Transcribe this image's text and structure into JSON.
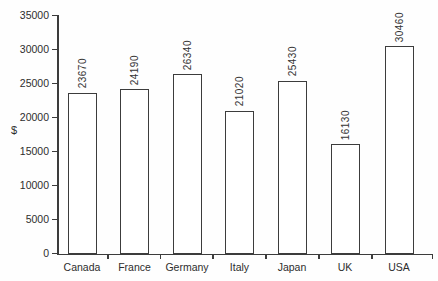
{
  "chart_data": {
    "type": "bar",
    "title": "",
    "xlabel": "",
    "ylabel": "$",
    "categories": [
      "Canada",
      "France",
      "Germany",
      "Italy",
      "Japan",
      "UK",
      "USA"
    ],
    "values": [
      23670,
      24190,
      26340,
      21020,
      25430,
      16130,
      30460
    ],
    "bar_labels": [
      "23670",
      "24190",
      "26340",
      "21020",
      "25430",
      "16130",
      "30460"
    ],
    "value_label_rotation": 90,
    "ylim": [
      0,
      35000
    ],
    "ytick_labels": [
      "0",
      "5000",
      "10000",
      "15000",
      "20000",
      "25000",
      "30000",
      "35000"
    ],
    "grid": false,
    "legend": null,
    "bar_fill": "#ffffff",
    "bar_border": "#3c3c3c",
    "axis_color": "#3c3c3c",
    "text_color": "#2d2d2d"
  }
}
